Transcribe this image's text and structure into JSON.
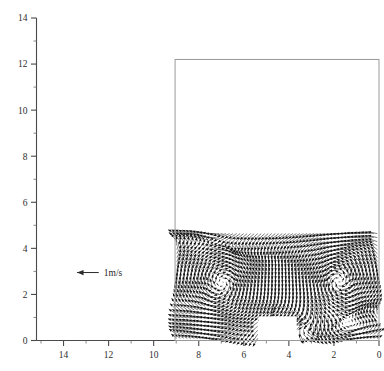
{
  "chart_data": {
    "type": "quiver",
    "title": "",
    "subtitle": "",
    "xlabel": "",
    "ylabel": "",
    "xlim": [
      15.2,
      0.0
    ],
    "ylim": [
      0,
      14
    ],
    "x_axis_reversed": true,
    "grid": false,
    "legend_position": "inside-left",
    "x_ticks_major": [
      14,
      12,
      10,
      8,
      6,
      4,
      2,
      0
    ],
    "x_tick_labels": [
      "14",
      "12",
      "10",
      "8",
      "6",
      "4",
      "2",
      "0"
    ],
    "x_ticks_minor": [
      15,
      13,
      11,
      9,
      7,
      5,
      3,
      1
    ],
    "y_ticks_major": [
      0,
      2,
      4,
      6,
      8,
      10,
      12,
      14
    ],
    "y_tick_labels": [
      "0",
      "2",
      "4",
      "6",
      "8",
      "10",
      "12",
      "14"
    ],
    "y_ticks_minor": [
      1,
      3,
      5,
      7,
      9,
      11,
      13
    ],
    "domain_box": {
      "x_from": 9.05,
      "x_to": 0.0,
      "y_from": 0.0,
      "y_to": 12.2,
      "label": "computational-domain"
    },
    "vector_field_extent": {
      "x_from": 9.05,
      "x_to": 0.0,
      "y_from": 0.0,
      "y_to": 4.72
    },
    "obstacle": {
      "x_from": 5.35,
      "x_to": 3.65,
      "y_from": 0.0,
      "y_to": 1.05,
      "label": "solid-block"
    },
    "scale_arrow": {
      "label": "1m/s",
      "magnitude": 1,
      "units": "m/s",
      "direction": "left",
      "x": 13.4,
      "y": 2.95
    },
    "features": [
      {
        "name": "left-recirculation-vortex",
        "center_x": 6.6,
        "center_y": 2.5,
        "sense": "counter-clockwise"
      },
      {
        "name": "right-recirculation-vortex",
        "center_x": 2.1,
        "center_y": 2.6,
        "sense": "clockwise"
      },
      {
        "name": "upper-shear-jet",
        "y": 4.5,
        "direction": "leftward"
      },
      {
        "name": "lower-return-jet",
        "y": 0.9,
        "direction": "leftward"
      }
    ],
    "series": [
      {
        "name": "velocity-vectors",
        "color": "#111111",
        "description": "2-D velocity vector field of a recirculating cavity flow with a bottom-mounted block"
      }
    ]
  },
  "figure": {
    "background_color": "#ffffff",
    "axis_color": "#4a4a4a",
    "box_color": "#9a9a9a",
    "vector_color": "#111111"
  }
}
